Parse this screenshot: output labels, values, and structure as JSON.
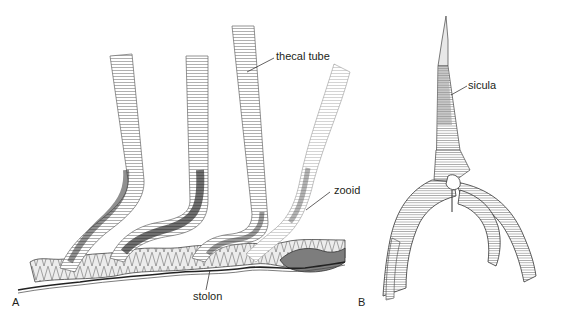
{
  "figure": {
    "panel_a": {
      "letter": "A",
      "labels": {
        "thecal_tube": "thecal tube",
        "zooid": "zooid",
        "stolon": "stolon"
      }
    },
    "panel_b": {
      "letter": "B",
      "labels": {
        "sicula": "sicula"
      }
    },
    "colors": {
      "ink": "#231f20",
      "line": "#555555",
      "shade_dark": "#3a3a3a",
      "shade_mid": "#8a8a8a",
      "shade_light": "#cfcfcf",
      "background": "#ffffff"
    }
  }
}
